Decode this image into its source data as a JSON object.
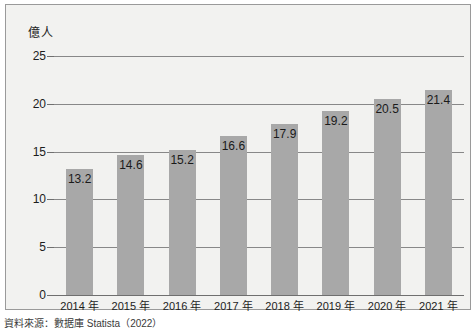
{
  "chart_data": {
    "type": "bar",
    "title": "",
    "subtitle": "",
    "xlabel": "",
    "ylabel": "億人",
    "ylim": [
      0,
      25
    ],
    "yticks": [
      0,
      5,
      10,
      15,
      20,
      25
    ],
    "ytick_labels": [
      "0",
      "5",
      "10",
      "15",
      "20",
      "25"
    ],
    "grid": true,
    "legend": false,
    "legend_position": "none",
    "categories": [
      "2014 年",
      "2015 年",
      "2016 年",
      "2017 年",
      "2018 年",
      "2019 年",
      "2020 年",
      "2021 年"
    ],
    "values": [
      13.2,
      14.6,
      15.2,
      16.6,
      17.9,
      19.2,
      20.5,
      21.4
    ],
    "data_labels": [
      "13.2",
      "14.6",
      "15.2",
      "16.6",
      "17.9",
      "19.2",
      "20.5",
      "21.4"
    ],
    "bar_color": "#a8a8a8",
    "plot_background": "#f2f2f0",
    "gridline_color": "#888888",
    "axis_color": "#6f6f6f",
    "border_color": "#9a9a9a",
    "text_color": "#1a1a1a"
  },
  "caption": {
    "source": "資料來源：數据庫 Statista（2022）"
  }
}
